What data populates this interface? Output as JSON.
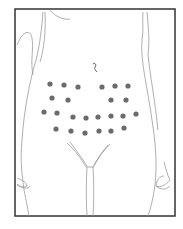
{
  "diagram": {
    "title": "",
    "frame": {
      "x": 15,
      "y": 9,
      "width": 160,
      "height": 207,
      "stroke": "#333333"
    },
    "colors": {
      "outline": "#9a9a9a",
      "dot": "#6b6b6b",
      "background": "#ffffff"
    },
    "injection_points": [
      {
        "x": 50,
        "y": 84
      },
      {
        "x": 64,
        "y": 85
      },
      {
        "x": 78,
        "y": 87
      },
      {
        "x": 102,
        "y": 87
      },
      {
        "x": 115,
        "y": 86
      },
      {
        "x": 128,
        "y": 86
      },
      {
        "x": 52,
        "y": 98
      },
      {
        "x": 68,
        "y": 100
      },
      {
        "x": 111,
        "y": 100
      },
      {
        "x": 126,
        "y": 100
      },
      {
        "x": 44,
        "y": 112
      },
      {
        "x": 57,
        "y": 113
      },
      {
        "x": 73,
        "y": 117
      },
      {
        "x": 86,
        "y": 118
      },
      {
        "x": 98,
        "y": 117
      },
      {
        "x": 111,
        "y": 116
      },
      {
        "x": 123,
        "y": 116
      },
      {
        "x": 136,
        "y": 114
      },
      {
        "x": 56,
        "y": 129
      },
      {
        "x": 71,
        "y": 131
      },
      {
        "x": 85,
        "y": 133
      },
      {
        "x": 99,
        "y": 131
      },
      {
        "x": 111,
        "y": 131
      },
      {
        "x": 124,
        "y": 128
      }
    ],
    "point_count": 24
  }
}
